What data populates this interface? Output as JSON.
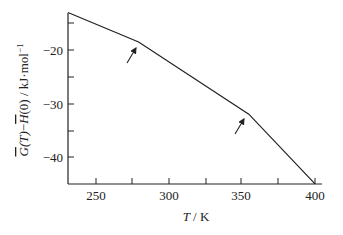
{
  "chart_data": {
    "type": "line",
    "title": "",
    "xlabel": "T / K",
    "ylabel": "Ḡ(T) − H̄(0) / kJ·mol⁻¹",
    "xlim": [
      232,
      400
    ],
    "ylim": [
      -45,
      -13
    ],
    "grid": false,
    "legend": null,
    "x_ticks": [
      250,
      300,
      350,
      400
    ],
    "x_minor_ticks": [
      275,
      325,
      375
    ],
    "y_ticks": [
      -20,
      -30,
      -40
    ],
    "y_minor_ticks": [
      -15,
      -25,
      -35
    ],
    "series": [
      {
        "name": "G(T)-H(0)",
        "x": [
          232,
          280,
          355,
          400
        ],
        "y": [
          -13,
          -18.5,
          -32,
          -45
        ]
      }
    ],
    "annotations": [
      {
        "type": "arrow",
        "points_to": {
          "x": 280,
          "y": -18.5
        },
        "label": ""
      },
      {
        "type": "arrow",
        "points_to": {
          "x": 355,
          "y": -32
        },
        "label": ""
      }
    ]
  },
  "labels": {
    "x_axis": "T / K",
    "y_axis_parts": {
      "g": "G",
      "t": "(T)",
      "minus": "−",
      "h": "H",
      "zero": "(0) / kJ·mol",
      "sup": "−1"
    },
    "x_tick_labels": [
      "250",
      "300",
      "350",
      "400"
    ],
    "y_tick_labels": [
      "−20",
      "−30",
      "−40"
    ]
  }
}
